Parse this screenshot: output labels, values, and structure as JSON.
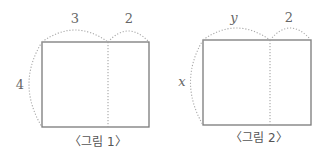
{
  "figures": [
    {
      "caption": "〈그림 1〉",
      "top_left_label": "3",
      "top_right_label": "2",
      "side_label": "4"
    },
    {
      "caption": "〈그림 2〉",
      "top_left_label": "y",
      "top_right_label": "2",
      "side_label": "x"
    }
  ]
}
